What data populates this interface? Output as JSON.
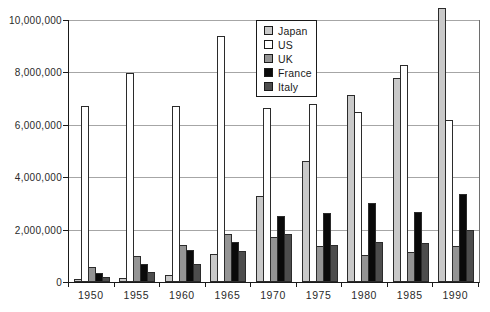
{
  "chart_data": {
    "type": "bar",
    "title": "",
    "xlabel": "",
    "ylabel": "",
    "grid": true,
    "legend_position": "top-center",
    "categories": [
      "1950",
      "1955",
      "1960",
      "1965",
      "1970",
      "1975",
      "1980",
      "1985",
      "1990"
    ],
    "series": [
      {
        "name": "Japan",
        "color": "#c9c9c9",
        "values": [
          30000,
          70000,
          200000,
          1000000,
          3200000,
          4550000,
          7050000,
          7700000,
          10400000
        ]
      },
      {
        "name": "US",
        "color": "#ffffff",
        "values": [
          6650000,
          7900000,
          6650000,
          9300000,
          6550000,
          6700000,
          6400000,
          8200000,
          6100000
        ]
      },
      {
        "name": "UK",
        "color": "#949494",
        "values": [
          500000,
          900000,
          1350000,
          1750000,
          1650000,
          1300000,
          950000,
          1050000,
          1300000
        ]
      },
      {
        "name": "France",
        "color": "#0a0a0a",
        "values": [
          250000,
          600000,
          1150000,
          1450000,
          2450000,
          2550000,
          2950000,
          2600000,
          3300000
        ]
      },
      {
        "name": "Italy",
        "color": "#4d4d4d",
        "values": [
          120000,
          300000,
          600000,
          1100000,
          1750000,
          1350000,
          1450000,
          1400000,
          1900000
        ]
      }
    ],
    "ylim": [
      0,
      10000000
    ],
    "yticks": [
      0,
      2000000,
      4000000,
      6000000,
      8000000,
      10000000
    ],
    "ytick_labels": [
      "0",
      "2,000,000",
      "4,000,000",
      "6,000,000",
      "8,000,000",
      "10,000,000"
    ]
  }
}
